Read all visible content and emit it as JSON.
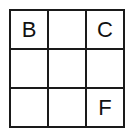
{
  "grid": {
    "rows": 3,
    "cols": 3,
    "cells": [
      [
        "B",
        "",
        "C"
      ],
      [
        "",
        "",
        ""
      ],
      [
        "",
        "",
        "F"
      ]
    ]
  }
}
